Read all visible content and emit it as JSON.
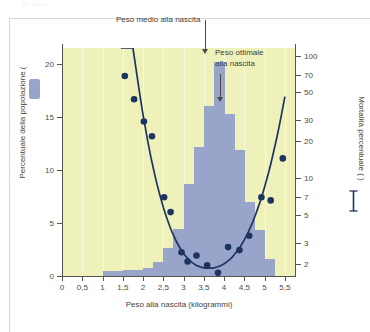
{
  "figure": {
    "ghost_caption": "gli stessi",
    "background_color": "#eff1bb",
    "bar_color": "#98a4ca",
    "curve_color": "#1d3461",
    "axis_color": "#56564f"
  },
  "annotations": [
    {
      "id": "mean",
      "text": "Peso medio alla nascita",
      "arrow_to_x": 3.5
    },
    {
      "id": "optimal",
      "line1": "Peso ottimale",
      "line2": "alla nascita",
      "arrow_to_x": 3.8
    }
  ],
  "legend": {
    "bar_symbol": "bar-swatch",
    "line_symbol": "line-swatch"
  },
  "chart_data": {
    "type": "bar",
    "title": "",
    "xlabel": "Peso alla nascita (kilogrammi)",
    "ylabel_left": "Percentuale della popolazione (",
    "ylabel_right": "Mortalità percentuale (",
    "ylabel_right_suffix": ")",
    "xlim": [
      0,
      5.75
    ],
    "xticks": [
      0,
      0.5,
      1,
      1.5,
      2,
      2.5,
      3,
      3.5,
      4,
      4.5,
      5,
      5.5
    ],
    "xticklabels": [
      "0",
      "0,5",
      "1",
      "1,5",
      "2",
      "2,5",
      "3",
      "3,5",
      "4",
      "4,5",
      "5",
      "5,5"
    ],
    "ylim_left": [
      0,
      21.5
    ],
    "yticks_left": [
      0,
      5,
      10,
      15,
      20
    ],
    "yticklabels_left": [
      "0",
      "5",
      "10",
      "15",
      "20"
    ],
    "yscale_right": "log",
    "ylim_right": [
      1.6,
      115
    ],
    "yticks_right": [
      100,
      70,
      50,
      30,
      20,
      10,
      7,
      5,
      3,
      2
    ],
    "yticklabels_right": [
      "100",
      "70",
      "50",
      "30",
      "20",
      "10",
      "7",
      "5",
      "3",
      "2"
    ],
    "grid": "vertical-light",
    "legend_position": "axis-labels",
    "series": [
      {
        "name": "Percentuale della popolazione",
        "type": "bar",
        "color": "#98a4ca",
        "bin_width": 0.25,
        "bin_centers": [
          1.125,
          1.375,
          1.625,
          1.875,
          2.125,
          2.375,
          2.625,
          2.875,
          3.125,
          3.375,
          3.625,
          3.875,
          4.125,
          4.375,
          4.625,
          4.875,
          5.125
        ],
        "values": [
          0.5,
          0.5,
          0.6,
          0.6,
          0.8,
          1.3,
          2.6,
          4.4,
          8.7,
          12.2,
          16.0,
          20.2,
          15.3,
          11.9,
          7.0,
          4.3,
          1.6
        ]
      },
      {
        "name": "Mortalità percentuale",
        "type": "scatter+line",
        "color": "#1d3461",
        "points": [
          {
            "x": 1.55,
            "y": 68
          },
          {
            "x": 1.78,
            "y": 44
          },
          {
            "x": 2.02,
            "y": 29
          },
          {
            "x": 2.22,
            "y": 22
          },
          {
            "x": 2.52,
            "y": 7.0
          },
          {
            "x": 2.68,
            "y": 5.3
          },
          {
            "x": 2.95,
            "y": 2.5
          },
          {
            "x": 3.1,
            "y": 2.1
          },
          {
            "x": 3.32,
            "y": 2.35
          },
          {
            "x": 3.58,
            "y": 1.95
          },
          {
            "x": 3.85,
            "y": 1.7
          },
          {
            "x": 4.1,
            "y": 2.75
          },
          {
            "x": 4.38,
            "y": 2.6
          },
          {
            "x": 4.62,
            "y": 3.4
          },
          {
            "x": 4.92,
            "y": 7.0
          },
          {
            "x": 5.15,
            "y": 6.6
          },
          {
            "x": 5.45,
            "y": 14.5
          }
        ],
        "fit_curve": "U-shaped, minimum near 3.6 kg"
      }
    ]
  }
}
